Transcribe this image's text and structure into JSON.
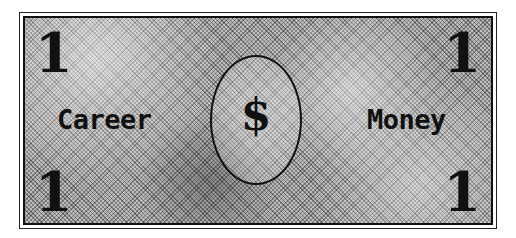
{
  "bill": {
    "denomination": "1",
    "left_word": "Career",
    "right_word": "Money",
    "center_symbol": "$",
    "colors": {
      "ink": "#111111",
      "paper": "#bdbdbd",
      "background": "#ffffff"
    }
  }
}
